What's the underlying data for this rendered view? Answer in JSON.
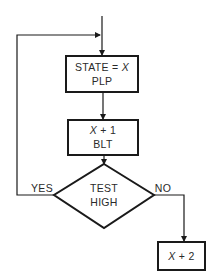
{
  "diagram": {
    "type": "flowchart",
    "nodes": [
      {
        "id": "state",
        "shape": "process",
        "line1_prefix": "STATE = ",
        "line1_var": "X",
        "line2": "PLP"
      },
      {
        "id": "inc1",
        "shape": "process",
        "line1_var": "X",
        "line1_suffix": " + 1",
        "line2": "BLT"
      },
      {
        "id": "test",
        "shape": "decision",
        "line1": "TEST",
        "line2": "HIGH"
      },
      {
        "id": "inc2",
        "shape": "process",
        "line1_var": "X",
        "line1_suffix": " + 2"
      }
    ],
    "edges": [
      {
        "from": "entry",
        "to": "state"
      },
      {
        "from": "state",
        "to": "inc1"
      },
      {
        "from": "inc1",
        "to": "test"
      },
      {
        "from": "test",
        "to": "state",
        "label": "YES"
      },
      {
        "from": "test",
        "to": "inc2",
        "label": "NO"
      }
    ],
    "edge_labels": {
      "yes": "YES",
      "no": "NO"
    },
    "colors": {
      "line": "#1a1a1a",
      "background": "#ffffff",
      "text": "#2a2a2a"
    }
  }
}
